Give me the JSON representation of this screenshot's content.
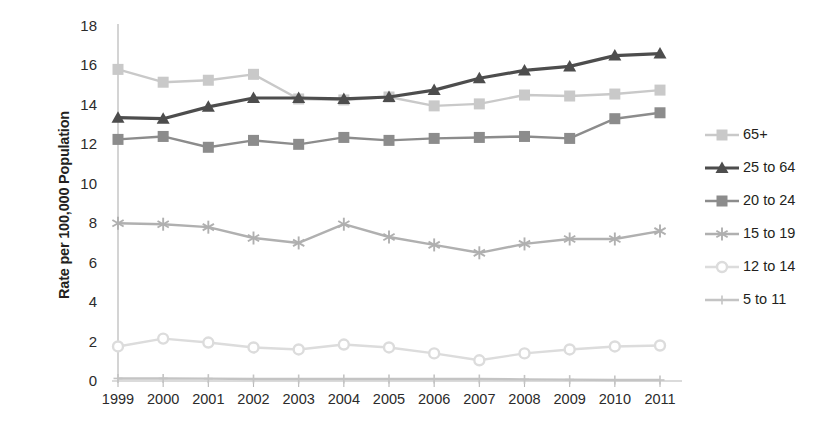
{
  "chart_data": {
    "type": "line",
    "title": "",
    "xlabel": "",
    "ylabel": "Rate per 100,000 Population",
    "categories": [
      "1999",
      "2000",
      "2001",
      "2002",
      "2003",
      "2004",
      "2005",
      "2006",
      "2007",
      "2008",
      "2009",
      "2010",
      "2011"
    ],
    "x": [
      1999,
      2000,
      2001,
      2002,
      2003,
      2004,
      2005,
      2006,
      2007,
      2008,
      2009,
      2010,
      2011
    ],
    "ylim": [
      0,
      18
    ],
    "xlim": [
      1999,
      2011
    ],
    "y_ticks": [
      0,
      2,
      4,
      6,
      8,
      10,
      12,
      14,
      16,
      18
    ],
    "grid": false,
    "legend_position": "right",
    "series": [
      {
        "name": "65+",
        "marker": "square",
        "color": "#c9c9c9",
        "values": [
          15.8,
          15.15,
          15.25,
          15.55,
          14.3,
          14.25,
          14.4,
          13.95,
          14.05,
          14.5,
          14.45,
          14.55,
          14.75
        ]
      },
      {
        "name": "25 to 64",
        "marker": "triangle",
        "color": "#4d4d4d",
        "values": [
          13.35,
          13.3,
          13.9,
          14.35,
          14.35,
          14.3,
          14.4,
          14.75,
          15.35,
          15.75,
          15.95,
          16.5,
          16.6
        ]
      },
      {
        "name": "20 to 24",
        "marker": "square",
        "color": "#8c8c8c",
        "values": [
          12.25,
          12.4,
          11.85,
          12.2,
          12.0,
          12.35,
          12.2,
          12.3,
          12.35,
          12.4,
          12.3,
          13.3,
          13.6
        ]
      },
      {
        "name": "15 to 19",
        "marker": "asterisk",
        "color": "#b0b0b0",
        "values": [
          8.0,
          7.95,
          7.8,
          7.25,
          7.0,
          7.95,
          7.3,
          6.9,
          6.5,
          6.95,
          7.2,
          7.2,
          7.6
        ]
      },
      {
        "name": "12 to 14",
        "marker": "circle",
        "color": "#dcdcdc",
        "values": [
          1.75,
          2.15,
          1.95,
          1.7,
          1.6,
          1.85,
          1.7,
          1.4,
          1.05,
          1.4,
          1.6,
          1.75,
          1.8
        ]
      },
      {
        "name": "5 to 11",
        "marker": "plus",
        "color": "#c4c4c4",
        "values": [
          0.13,
          0.13,
          0.12,
          0.1,
          0.1,
          0.1,
          0.1,
          0.1,
          0.1,
          0.08,
          0.07,
          0.05,
          0.05
        ]
      }
    ]
  },
  "axis": {
    "y_title": "Rate per 100,000 Population",
    "y_tick_labels": [
      "18",
      "16",
      "14",
      "12",
      "10",
      "8",
      "6",
      "4",
      "2",
      "0"
    ],
    "x_tick_labels": [
      "1999",
      "2000",
      "2001",
      "2002",
      "2003",
      "2004",
      "2005",
      "2006",
      "2007",
      "2008",
      "2009",
      "2010",
      "2011"
    ]
  },
  "legend": {
    "items": [
      {
        "label": "65+"
      },
      {
        "label": "25 to 64"
      },
      {
        "label": "20 to 24"
      },
      {
        "label": "15 to 19"
      },
      {
        "label": "12 to 14"
      },
      {
        "label": "5 to 11"
      }
    ]
  },
  "colors": {
    "axis_line": "#b8b8b8",
    "text": "#231f20",
    "background": "#ffffff"
  }
}
